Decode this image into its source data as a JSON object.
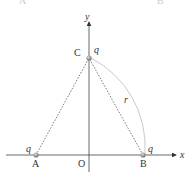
{
  "figure": {
    "top_residual": {
      "left": "A",
      "right": "B"
    },
    "axes": {
      "x_label": "x",
      "y_label": "y",
      "origin_label": "O"
    },
    "points": {
      "A": {
        "label": "A",
        "charge": "q"
      },
      "B": {
        "label": "B",
        "charge": "q"
      },
      "C": {
        "label": "C",
        "charge": "q"
      }
    },
    "arc_label": "r",
    "colors": {
      "axis": "#444444",
      "dotted": "#555555",
      "arc": "#bbbbbb",
      "charge": "#888888"
    }
  }
}
